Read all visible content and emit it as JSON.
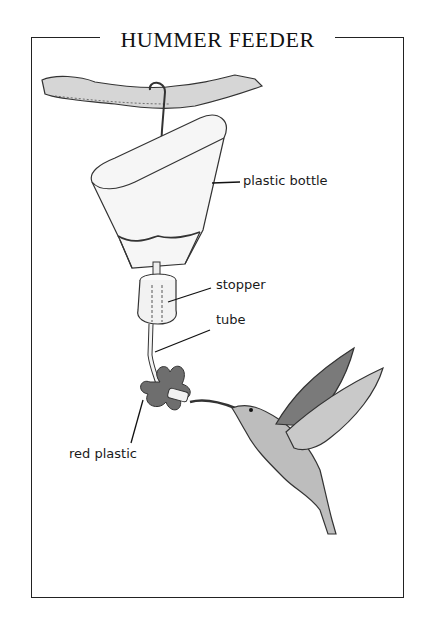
{
  "title": "HUMMER FEEDER",
  "labels": {
    "plastic_bottle": "plastic bottle",
    "stopper": "stopper",
    "tube": "tube",
    "red_plastic": "red plastic"
  },
  "colors": {
    "frame": "#222222",
    "ink": "#1a1a1a",
    "branch_fill": "#d8d8d8",
    "flower_fill": "#6e6e6e",
    "bird_body": "#bdbdbd",
    "bird_wing": "#7a7a7a"
  }
}
